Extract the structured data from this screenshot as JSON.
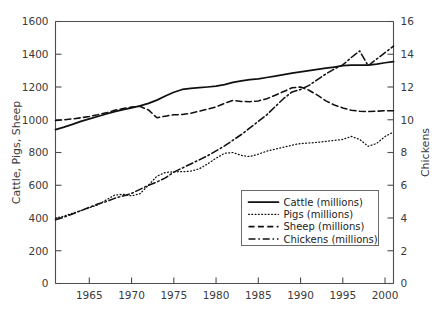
{
  "chart_data": {
    "type": "line",
    "title": "",
    "subtitle": "",
    "xlabel": "",
    "ylabel": "Cattle, Pigs, Sheep",
    "y2label": "Chickens",
    "grid": false,
    "legend_position": "center-right-inside",
    "xlim": [
      1961,
      2001
    ],
    "ylim": [
      0,
      1600
    ],
    "y2lim": [
      0,
      16
    ],
    "xticks": [
      1965,
      1970,
      1975,
      1980,
      1985,
      1990,
      1995,
      2000
    ],
    "xtick_labels": [
      "1965",
      "1970",
      "1975",
      "1980",
      "1985",
      "1990",
      "1995",
      "2000"
    ],
    "yticks": [
      0,
      200,
      400,
      600,
      800,
      1000,
      1200,
      1400,
      1600
    ],
    "ytick_labels": [
      "0",
      "200",
      "400",
      "600",
      "800",
      "1000",
      "1200",
      "1400",
      "1600"
    ],
    "y2ticks": [
      0,
      2,
      4,
      6,
      8,
      10,
      12,
      14,
      16
    ],
    "y2tick_labels": [
      "0",
      "2",
      "4",
      "6",
      "8",
      "10",
      "12",
      "14",
      "16"
    ],
    "x": [
      1961,
      1962,
      1963,
      1964,
      1965,
      1966,
      1967,
      1968,
      1969,
      1970,
      1971,
      1972,
      1973,
      1974,
      1975,
      1976,
      1977,
      1978,
      1979,
      1980,
      1981,
      1982,
      1983,
      1984,
      1985,
      1986,
      1987,
      1988,
      1989,
      1990,
      1991,
      1992,
      1993,
      1994,
      1995,
      1996,
      1997,
      1998,
      1999,
      2000,
      2001
    ],
    "series": [
      {
        "name": "Cattle (millions)",
        "axis": "left",
        "line_style": "solid",
        "color": "#101010",
        "values": [
          940,
          955,
          972,
          990,
          1005,
          1020,
          1035,
          1050,
          1062,
          1073,
          1085,
          1100,
          1120,
          1145,
          1168,
          1185,
          1192,
          1196,
          1200,
          1205,
          1215,
          1228,
          1238,
          1245,
          1250,
          1258,
          1266,
          1275,
          1285,
          1292,
          1300,
          1308,
          1315,
          1322,
          1330,
          1333,
          1333,
          1334,
          1340,
          1348,
          1355
        ]
      },
      {
        "name": "Pigs (millions)",
        "axis": "left",
        "line_style": "dotted",
        "color": "#101010",
        "values": [
          400,
          412,
          428,
          445,
          462,
          480,
          510,
          540,
          545,
          535,
          548,
          600,
          655,
          678,
          682,
          683,
          686,
          700,
          730,
          765,
          795,
          800,
          782,
          775,
          790,
          808,
          820,
          832,
          845,
          855,
          858,
          862,
          868,
          874,
          880,
          898,
          880,
          838,
          855,
          898,
          925
        ]
      },
      {
        "name": "Sheep (millions)",
        "axis": "left",
        "line_style": "dashed",
        "color": "#101010",
        "values": [
          995,
          1000,
          1005,
          1012,
          1020,
          1030,
          1042,
          1058,
          1068,
          1078,
          1082,
          1060,
          1012,
          1022,
          1030,
          1032,
          1040,
          1052,
          1065,
          1078,
          1100,
          1118,
          1112,
          1110,
          1115,
          1128,
          1150,
          1172,
          1195,
          1200,
          1180,
          1150,
          1115,
          1090,
          1072,
          1058,
          1052,
          1050,
          1052,
          1055,
          1055
        ]
      },
      {
        "name": "Chickens (millions)",
        "axis": "right",
        "line_style": "dashdot",
        "color": "#101010",
        "values": [
          3.9,
          4.05,
          4.25,
          4.45,
          4.65,
          4.85,
          5.0,
          5.2,
          5.35,
          5.5,
          5.75,
          6.0,
          6.2,
          6.45,
          6.8,
          7.05,
          7.3,
          7.55,
          7.8,
          8.1,
          8.4,
          8.75,
          9.1,
          9.5,
          9.9,
          10.3,
          10.8,
          11.3,
          11.7,
          11.85,
          12.1,
          12.45,
          12.8,
          13.1,
          13.35,
          13.8,
          14.2,
          13.3,
          13.7,
          14.1,
          14.5
        ]
      }
    ]
  },
  "legend": {
    "entries": [
      {
        "label": "Cattle (millions)",
        "style": "solid"
      },
      {
        "label": "Pigs (millions)",
        "style": "dotted"
      },
      {
        "label": "Sheep (millions)",
        "style": "dashed"
      },
      {
        "label": "Chickens (millions)",
        "style": "dashdot"
      }
    ]
  }
}
